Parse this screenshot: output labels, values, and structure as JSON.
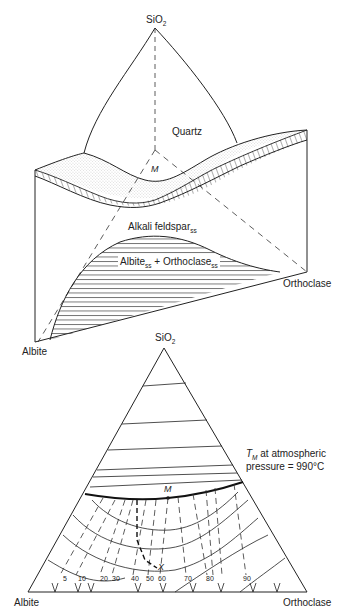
{
  "top_diagram": {
    "apex_label": "SiO",
    "apex_sub": "2",
    "region_quartz": "Quartz",
    "point_m": "M",
    "region_alkali": "Alkali feldspar",
    "region_alkali_sub": "ss",
    "region_two_feldspar_a": "Albite",
    "region_two_feldspar_a_sub": "ss",
    "region_two_feldspar_plus": " + Orthoclase",
    "region_two_feldspar_b_sub": "ss",
    "left_corner": "Albite",
    "right_corner": "Orthoclase"
  },
  "bottom_diagram": {
    "apex_label": "SiO",
    "apex_sub": "2",
    "point_m": "M",
    "annotation_t": "T",
    "annotation_t_sub": "M",
    "annotation_line1": " at atmospheric",
    "annotation_line2": "pressure = 990°C",
    "point_x": "X",
    "left_corner": "Albite",
    "right_corner": "Orthoclase",
    "tick_labels": [
      "5",
      "10",
      "20",
      "30",
      "40",
      "50",
      "60",
      "70",
      "80",
      "90"
    ]
  }
}
